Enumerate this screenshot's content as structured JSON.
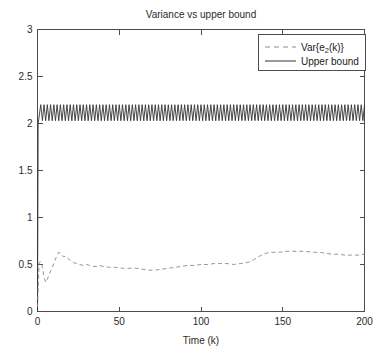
{
  "chart_data": {
    "type": "line",
    "title": "Variance vs upper bound",
    "xlabel": "Time (k)",
    "ylabel": "",
    "xlim": [
      0,
      200
    ],
    "ylim": [
      0,
      3
    ],
    "xticks": [
      0,
      50,
      100,
      150,
      200
    ],
    "xticklabels": [
      "0",
      "50",
      "100",
      "150",
      "200"
    ],
    "yticks": [
      0,
      0.5,
      1,
      1.5,
      2,
      2.5,
      3
    ],
    "yticklabels": [
      "0",
      "0.5",
      "1",
      "1.5",
      "2",
      "2.5",
      "3"
    ],
    "grid": false,
    "legend_position": "upper right",
    "legend_entries": [
      {
        "label_prefix": "Var{e",
        "label_sub": "2",
        "label_suffix": "(k)}",
        "label_plain": "Var{e2(k)}",
        "style": "dashed",
        "color": "#8a8a8a"
      },
      {
        "label_prefix": "Upper bound",
        "label_sub": "",
        "label_suffix": "",
        "label_plain": "Upper bound",
        "style": "solid",
        "color": "#333333"
      }
    ],
    "series": [
      {
        "name": "Var{e2(k)}",
        "style": "dashed",
        "color": "#8a8a8a",
        "x": [
          0,
          1,
          2,
          3,
          4,
          5,
          6,
          7,
          8,
          9,
          10,
          11,
          12,
          13,
          14,
          15,
          16,
          17,
          18,
          19,
          20,
          22,
          24,
          26,
          28,
          30,
          32,
          34,
          36,
          38,
          40,
          44,
          48,
          52,
          56,
          60,
          64,
          68,
          72,
          76,
          80,
          84,
          88,
          92,
          96,
          100,
          104,
          108,
          112,
          116,
          120,
          124,
          128,
          130,
          132,
          134,
          136,
          138,
          140,
          142,
          144,
          148,
          152,
          156,
          160,
          164,
          168,
          172,
          176,
          180,
          184,
          188,
          192,
          196,
          200
        ],
        "y": [
          0.05,
          0.52,
          0.53,
          0.47,
          0.36,
          0.31,
          0.34,
          0.39,
          0.43,
          0.47,
          0.51,
          0.56,
          0.6,
          0.63,
          0.62,
          0.6,
          0.58,
          0.59,
          0.58,
          0.56,
          0.54,
          0.52,
          0.51,
          0.5,
          0.49,
          0.5,
          0.49,
          0.48,
          0.48,
          0.49,
          0.48,
          0.47,
          0.47,
          0.46,
          0.46,
          0.46,
          0.45,
          0.44,
          0.44,
          0.45,
          0.46,
          0.47,
          0.48,
          0.49,
          0.49,
          0.5,
          0.5,
          0.51,
          0.51,
          0.51,
          0.5,
          0.51,
          0.52,
          0.53,
          0.55,
          0.57,
          0.59,
          0.61,
          0.62,
          0.63,
          0.63,
          0.63,
          0.64,
          0.64,
          0.64,
          0.64,
          0.63,
          0.63,
          0.62,
          0.61,
          0.61,
          0.6,
          0.6,
          0.6,
          0.61
        ]
      },
      {
        "name": "Upper bound",
        "style": "solid",
        "color": "#333333",
        "description": "Fast period-2 oscillation between about 2.03 and 2.20, preceded by a vertical transient from 0 up to about 2 at k=0.",
        "transient_from": 0.0,
        "transient_to": 2.0,
        "osc_min": 2.03,
        "osc_max": 2.2,
        "osc_period": 2,
        "osc_start_k": 2,
        "osc_end_k": 200
      }
    ]
  },
  "figure": {
    "background": "#ffffff",
    "axis_color": "#4d4d4d",
    "text_color": "#2b2b2b"
  }
}
